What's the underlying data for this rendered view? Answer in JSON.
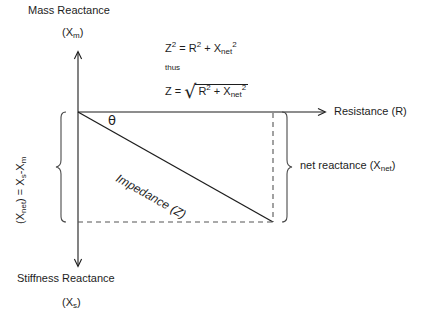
{
  "diagram": {
    "title_axis_top": "Mass Reactance",
    "axis_top_symbol_open": "(X",
    "axis_top_symbol_sub": "m",
    "axis_top_symbol_close": ")",
    "title_axis_bottom": "Stiffness Reactance",
    "axis_bottom_symbol_open": "(X",
    "axis_bottom_symbol_sub": "s",
    "axis_bottom_symbol_close": ")",
    "axis_right_label": "Resistance (R)",
    "angle_symbol": "θ",
    "hypotenuse_label": "Impedance (Z)",
    "brace_right_label_text": "net reactance (X",
    "brace_right_label_sub": "net",
    "brace_right_label_close": ")",
    "brace_left_label_open": "(X",
    "brace_left_label_sub": "net",
    "brace_left_label_mid": ") = X",
    "brace_left_label_sub2": "s",
    "brace_left_label_minus": "-X",
    "brace_left_label_sub3": "m",
    "equation_1": {
      "z": "Z",
      "z_exp": "2",
      "equals": " = R",
      "r_exp": "2",
      "plus": " +  X",
      "x_sub": "net",
      "x_exp": "2"
    },
    "thus": "thus",
    "equation_2": {
      "z_equals": "Z = ",
      "radical": "√",
      "r": "R",
      "r_exp": "2",
      "plus": " + X",
      "x_sub": "net",
      "x_exp": "2"
    },
    "colors": {
      "line": "#1d1d1d",
      "dashed": "#4a4a4a",
      "background": "#ffffff",
      "text": "#1d1d1d"
    }
  }
}
